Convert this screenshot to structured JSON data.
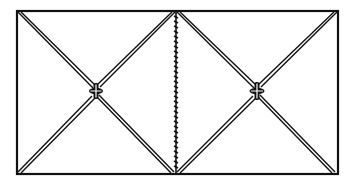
{
  "diagram": {
    "colors": {
      "line": "#111111",
      "background": "#ffffff"
    },
    "outer_rect": {
      "x1": 17,
      "y1": 11,
      "x2": 338,
      "y2": 174
    },
    "seam": {
      "x": 176,
      "y1": 12,
      "y2": 173,
      "style": "stitched"
    },
    "panels": [
      {
        "name": "left-square",
        "cx": 96,
        "cy": 91
      },
      {
        "name": "right-square",
        "cx": 257,
        "cy": 91
      }
    ]
  }
}
